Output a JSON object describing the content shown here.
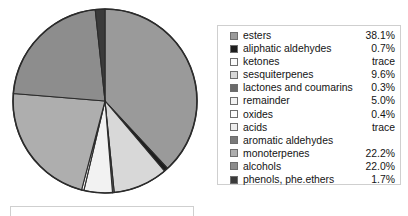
{
  "legend": {
    "rows": [
      {
        "label": "esters",
        "value": "38.1%",
        "color": "#9a9a9a"
      },
      {
        "label": "aliphatic aldehydes",
        "value": "0.7%",
        "color": "#1e1e1e"
      },
      {
        "label": "ketones",
        "value": "trace",
        "color": "#fbfbfb"
      },
      {
        "label": "sesquiterpenes",
        "value": "9.6%",
        "color": "#d8d8d8"
      },
      {
        "label": "lactones and coumarins",
        "value": "0.3%",
        "color": "#6a6a6a"
      },
      {
        "label": "remainder",
        "value": "5.0%",
        "color": "#f2f2f2"
      },
      {
        "label": "oxides",
        "value": "0.4%",
        "color": "#fcfcfc"
      },
      {
        "label": "acids",
        "value": "trace",
        "color": "#ededed"
      },
      {
        "label": "aromatic aldehydes",
        "value": "",
        "color": "#7a7a7a"
      },
      {
        "label": "monoterpenes",
        "value": "22.2%",
        "color": "#aeaeae"
      },
      {
        "label": "alcohols",
        "value": "22.0%",
        "color": "#8d8d8d"
      },
      {
        "label": "phenols, phe.ethers",
        "value": "1.7%",
        "color": "#3a3a3a"
      }
    ]
  },
  "chart_data": {
    "type": "pie",
    "title": "",
    "legend_position": "right",
    "units": "percent",
    "note": "aromatic aldehydes has no printed value; ketones and acids are listed as 'trace'",
    "categories": [
      "esters",
      "aliphatic aldehydes",
      "ketones",
      "sesquiterpenes",
      "lactones and coumarins",
      "remainder",
      "oxides",
      "acids",
      "aromatic aldehydes",
      "monoterpenes",
      "alcohols",
      "phenols, phe.ethers"
    ],
    "values": [
      38.1,
      0.7,
      0.0,
      9.6,
      0.3,
      5.0,
      0.4,
      0.0,
      0.0,
      22.2,
      22.0,
      1.7
    ],
    "labels": [
      "38.1%",
      "0.7%",
      "trace",
      "9.6%",
      "0.3%",
      "5.0%",
      "0.4%",
      "trace",
      "",
      "22.2%",
      "22.0%",
      "1.7%"
    ],
    "colors": [
      "#9a9a9a",
      "#1e1e1e",
      "#fbfbfb",
      "#d8d8d8",
      "#6a6a6a",
      "#f2f2f2",
      "#fcfcfc",
      "#ededed",
      "#7a7a7a",
      "#aeaeae",
      "#8d8d8d",
      "#3a3a3a"
    ],
    "start_angle_deg": -90,
    "direction": "clockwise",
    "stroke": "#2b2b2b"
  },
  "pie_geometry": {
    "cx": 97,
    "cy": 99,
    "r": 92
  }
}
